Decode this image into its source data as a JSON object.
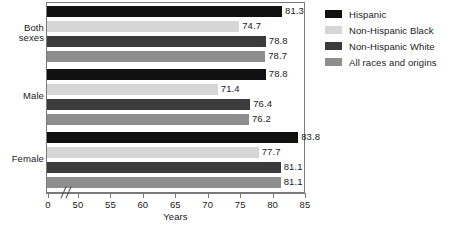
{
  "chart_data": {
    "type": "bar",
    "orientation": "horizontal",
    "title": "",
    "xlabel": "Years",
    "ylabel": "",
    "categories": [
      "Both sexes",
      "Male",
      "Female"
    ],
    "series": [
      {
        "name": "Hispanic",
        "color": "#111111",
        "values": [
          81.3,
          78.8,
          83.8
        ]
      },
      {
        "name": "Non-Hispanic Black",
        "color": "#d6d6d6",
        "values": [
          74.7,
          71.4,
          77.7
        ]
      },
      {
        "name": "Non-Hispanic White",
        "color": "#3b3b3b",
        "values": [
          78.8,
          76.4,
          81.1
        ]
      },
      {
        "name": "All races and origins",
        "color": "#8e8e8e",
        "values": [
          78.7,
          76.2,
          81.1
        ]
      }
    ],
    "xlim": [
      50,
      85
    ],
    "xticks": [
      0,
      50,
      55,
      60,
      65,
      70,
      75,
      80,
      85
    ],
    "xtick_labels": [
      "0",
      "50",
      "55",
      "60",
      "65",
      "70",
      "75",
      "80",
      "85"
    ],
    "axis_break": true,
    "grid": false,
    "legend_position": "right",
    "data_labels": [
      [
        "81.3",
        "74.7",
        "78.8",
        "78.7"
      ],
      [
        "78.8",
        "71.4",
        "76.4",
        "76.2"
      ],
      [
        "83.8",
        "77.7",
        "81.1",
        "81.1"
      ]
    ]
  },
  "group_labels": {
    "0": "Both\nsexes",
    "1": "Male",
    "2": "Female"
  },
  "axis": {
    "title": "Years",
    "tick_0": "0",
    "tick_50": "50",
    "tick_55": "55",
    "tick_60": "60",
    "tick_65": "65",
    "tick_70": "70",
    "tick_75": "75",
    "tick_80": "80",
    "tick_85": "85"
  },
  "legend": {
    "items": [
      {
        "label": "Hispanic"
      },
      {
        "label": "Non-Hispanic Black"
      },
      {
        "label": "Non-Hispanic White"
      },
      {
        "label": "All races and origins"
      }
    ]
  }
}
